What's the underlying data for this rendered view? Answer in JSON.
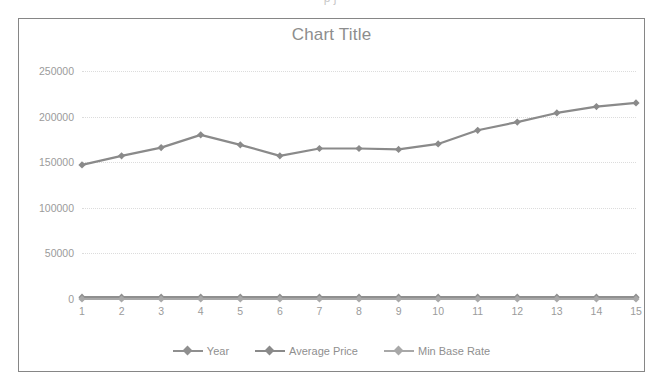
{
  "page": {
    "top_clipped_text": "p j"
  },
  "chart": {
    "title": "Chart Title",
    "border_color": "#868686",
    "title_color": "#8d8d8d",
    "tick_color": "#9b9b9b",
    "gridline_color": "#dcdcdc",
    "plot_background": "#ffffff"
  },
  "chart_data": {
    "type": "line",
    "title": "Chart Title",
    "xlabel": "",
    "ylabel": "",
    "categories": [
      "1",
      "2",
      "3",
      "4",
      "5",
      "6",
      "7",
      "8",
      "9",
      "10",
      "11",
      "12",
      "13",
      "14",
      "15"
    ],
    "ylim": [
      0,
      250000
    ],
    "ytick_labels": [
      "250000",
      "200000",
      "150000",
      "100000",
      "50000",
      "0"
    ],
    "yticks": [
      250000,
      200000,
      150000,
      100000,
      50000,
      0
    ],
    "grid": true,
    "legend_position": "bottom",
    "series": [
      {
        "name": "Year",
        "color": "#8f8f8f",
        "marker": "diamond",
        "values": [
          2003,
          2004,
          2005,
          2006,
          2007,
          2008,
          2009,
          2010,
          2011,
          2012,
          2013,
          2014,
          2015,
          2016,
          2017
        ]
      },
      {
        "name": "Average Price",
        "color": "#8a8a8a",
        "marker": "diamond",
        "values": [
          147000,
          157000,
          166000,
          180000,
          169000,
          157000,
          165000,
          165000,
          164000,
          170000,
          185000,
          194000,
          204000,
          211000,
          215000
        ]
      },
      {
        "name": "Min Base Rate",
        "color": "#a8a8a8",
        "marker": "diamond",
        "values": [
          3.75,
          4.5,
          4.5,
          4.75,
          5.5,
          4.5,
          0.5,
          0.5,
          0.5,
          0.5,
          0.5,
          0.5,
          0.5,
          0.25,
          0.25
        ]
      }
    ]
  }
}
